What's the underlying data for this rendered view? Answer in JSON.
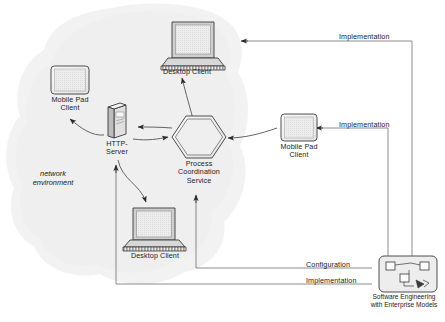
{
  "diagram": {
    "background_color": "#ffffff",
    "line_color": "#555555",
    "shape_fill": "#f2f2f2",
    "cloud_fill": "#f1f1f1",
    "environment": {
      "label": "network\nenvironment"
    },
    "nodes": [
      {
        "id": "desktop-client-top",
        "label": "Desktop Client",
        "icon": "laptop-icon",
        "x": 165,
        "y": 18
      },
      {
        "id": "mobile-pad-client-left",
        "label": "Mobile Pad\nClient",
        "icon": "tablet-icon",
        "x": 47,
        "y": 64
      },
      {
        "id": "http-server",
        "label": "HTTP-\nServer",
        "icon": "server-tower-icon",
        "x": 110,
        "y": 106
      },
      {
        "id": "process-coordination-service",
        "label": "Process\nCoordination\nService",
        "icon": "hexagon-icon",
        "x": 170,
        "y": 114
      },
      {
        "id": "mobile-pad-client-right",
        "label": "Mobile Pad\nClient",
        "icon": "tablet-icon",
        "x": 281,
        "y": 113
      },
      {
        "id": "desktop-client-bottom",
        "label": "Desktop Client",
        "icon": "laptop-icon",
        "x": 126,
        "y": 205
      },
      {
        "id": "software-engineering-tool",
        "label": "Software Engineering\nwith Enterprise Models",
        "icon": "model-editor-icon",
        "x": 379,
        "y": 255
      }
    ],
    "edges": [
      {
        "id": "edge-implementation-desktop-top",
        "label": "Implementation",
        "from": "software-engineering-tool",
        "to": "desktop-client-top"
      },
      {
        "id": "edge-implementation-mobile-right",
        "label": "Implementation",
        "from": "software-engineering-tool",
        "to": "mobile-pad-client-right"
      },
      {
        "id": "edge-configuration",
        "label": "Configuration",
        "from": "software-engineering-tool",
        "to": "process-coordination-service"
      },
      {
        "id": "edge-implementation-http",
        "label": "Implementation",
        "from": "software-engineering-tool",
        "to": "http-server"
      },
      {
        "id": "edge-http-to-mobile-left",
        "label": "",
        "from": "http-server",
        "to": "mobile-pad-client-left"
      },
      {
        "id": "edge-service-to-http",
        "label": "",
        "from": "process-coordination-service",
        "to": "http-server"
      },
      {
        "id": "edge-http-to-service",
        "label": "",
        "from": "http-server",
        "to": "process-coordination-service"
      },
      {
        "id": "edge-service-to-desktop-top",
        "label": "",
        "from": "process-coordination-service",
        "to": "desktop-client-top"
      },
      {
        "id": "edge-mobile-right-to-service",
        "label": "",
        "from": "mobile-pad-client-right",
        "to": "process-coordination-service"
      },
      {
        "id": "edge-http-to-desktop-bottom",
        "label": "",
        "from": "http-server",
        "to": "desktop-client-bottom"
      }
    ],
    "edge_labels": {
      "implementation_top": "Implementation",
      "implementation_middle": "Implementation",
      "configuration_bottom": "Configuration",
      "implementation_bottom": "Implementation"
    }
  }
}
